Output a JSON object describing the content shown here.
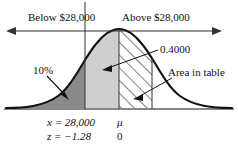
{
  "diagram": {
    "type": "normal-distribution-curve",
    "title_labels": {
      "below": "Below $28,000",
      "above": "Above $28,000"
    },
    "annotations": {
      "tail_percent": "10%",
      "area_value": "0.4000",
      "area_in_table": "Area in table"
    },
    "axis_labels": {
      "x_value": "x = 28,000",
      "z_value": "z = −1.28",
      "mu_symbol": "μ",
      "mu_zero": "0"
    },
    "colors": {
      "curve": "#111111",
      "dark_shade": "#8a8a8a",
      "light_shade": "#cfcfcf",
      "hatch": "#1a1a1a",
      "axis": "#111111"
    },
    "regions": [
      {
        "name": "left-tail-10-percent",
        "fill": "dark",
        "from": "-infinity",
        "to": "x = 28,000"
      },
      {
        "name": "x-to-mu-shaded",
        "fill": "light",
        "from": "x = 28,000",
        "to": "mu"
      },
      {
        "name": "mu-to-z-hatched",
        "fill": "hatched",
        "from": "mu",
        "to": "z = 1.28"
      }
    ]
  }
}
